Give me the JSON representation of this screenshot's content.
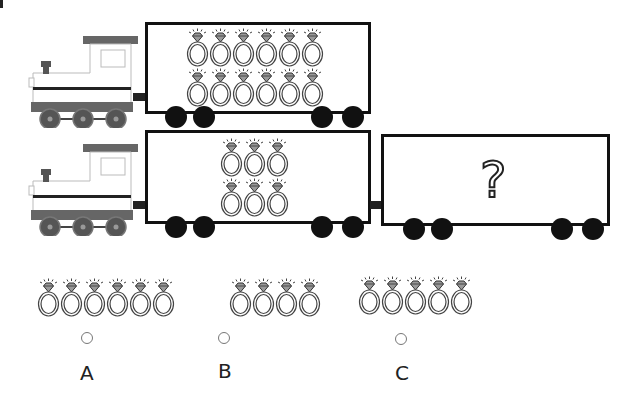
{
  "question": {
    "train1": {
      "ring_count": 12,
      "rows": 2,
      "cols": 6
    },
    "train2": {
      "ring_count": 6,
      "rows": 2,
      "cols": 3,
      "unknown_car_symbol": "?"
    }
  },
  "options": [
    {
      "label": "A",
      "ring_count": 6
    },
    {
      "label": "B",
      "ring_count": 4
    },
    {
      "label": "C",
      "ring_count": 5
    }
  ],
  "icons": {
    "ring": "diamond-ring-icon",
    "engine": "locomotive-icon"
  },
  "colors": {
    "stroke": "#111111",
    "engine_gray": "#666666",
    "ring_stroke": "#444444"
  }
}
